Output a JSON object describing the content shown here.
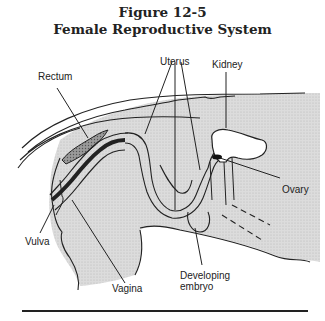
{
  "figure": {
    "number": "Figure 12-5",
    "title": "Female Reproductive System"
  },
  "labels": {
    "rectum": "Rectum",
    "uterus": "Uterus",
    "kidney": "Kidney",
    "ovary": "Ovary",
    "vulva": "Vulva",
    "vagina": "Vagina",
    "developing_embryo_line1": "Developing",
    "developing_embryo_line2": "embryo"
  },
  "colors": {
    "line": "#222222",
    "shading": "#d9d9d9",
    "background": "#ffffff"
  }
}
